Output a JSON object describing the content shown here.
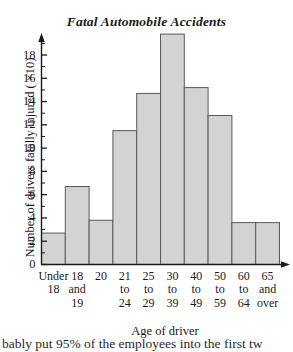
{
  "chart_data": {
    "type": "bar",
    "title": "Fatal  Automobile Accidents",
    "xlabel": "Age of driver",
    "ylabel": "Number of drivers fatally injured ( ×10)",
    "categories": [
      "Under 18",
      "18 and 19",
      "20",
      "21 to 24",
      "25 to 29",
      "30 to 39",
      "40 to 49",
      "50 to 59",
      "60 to 64",
      "65 and over"
    ],
    "category_lines": [
      [
        "Under",
        "18"
      ],
      [
        "18",
        "and",
        "19"
      ],
      [
        "20"
      ],
      [
        "21",
        "to",
        "24"
      ],
      [
        "25",
        "to",
        "29"
      ],
      [
        "30",
        "to",
        "39"
      ],
      [
        "40",
        "to",
        "49"
      ],
      [
        "50",
        "to",
        "59"
      ],
      [
        "60",
        "to",
        "64"
      ],
      [
        "65",
        "and",
        "over"
      ]
    ],
    "values": [
      2.7,
      6.7,
      3.8,
      11.5,
      14.7,
      19.8,
      15.2,
      12.8,
      3.6,
      3.6
    ],
    "ylim": [
      0,
      20
    ],
    "ytick_labels": [
      "0",
      "2",
      "4",
      "6",
      "8",
      "10",
      "12",
      "14",
      "16",
      "18"
    ],
    "ytick_values": [
      0,
      2,
      4,
      6,
      8,
      10,
      12,
      14,
      16,
      18
    ],
    "minor_tick_step": 1,
    "grid": false,
    "legend": null,
    "bar_fill": "#d3d3d3",
    "bar_stroke": "#5a5a5a",
    "axis_color": "#1a1a1a"
  },
  "page": {
    "tail_text": "bably put 95% of the employees into the first tw"
  }
}
